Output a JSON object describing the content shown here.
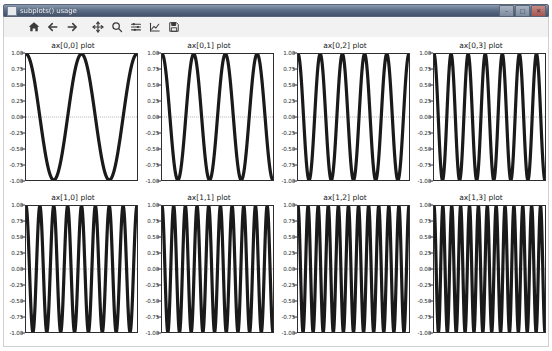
{
  "window": {
    "title": "subplots() usage",
    "icon": "app-icon",
    "buttons": [
      {
        "name": "minimize",
        "glyph": "–"
      },
      {
        "name": "maximize",
        "glyph": "□"
      },
      {
        "name": "close",
        "glyph": "✕"
      }
    ]
  },
  "toolbar": {
    "items": [
      {
        "name": "home-icon",
        "tooltip": "Reset original view"
      },
      {
        "name": "back-arrow-icon",
        "tooltip": "Back to previous view"
      },
      {
        "name": "forward-arrow-icon",
        "tooltip": "Forward to next view"
      },
      {
        "name": "pan-icon",
        "tooltip": "Pan axes with left mouse, zoom with right"
      },
      {
        "name": "zoom-icon",
        "tooltip": "Zoom to rectangle"
      },
      {
        "name": "subplot-config-icon",
        "tooltip": "Configure subplots"
      },
      {
        "name": "customize-icon",
        "tooltip": "Edit axis, curve and image parameters"
      },
      {
        "name": "save-icon",
        "tooltip": "Save the figure"
      }
    ]
  },
  "chart_data": {
    "type": "line",
    "title": "subplots() usage",
    "layout": {
      "rows": 2,
      "cols": 4,
      "sharey": true
    },
    "xlabel": "",
    "ylabel": "",
    "xlim": [
      0,
      1
    ],
    "ylim": [
      -1.0,
      1.0
    ],
    "grid": false,
    "legend": null,
    "ytick_labels": [
      "1.00",
      "0.75",
      "0.50",
      "0.25",
      "0.00",
      "-0.25",
      "-0.50",
      "-0.75",
      "-1.00"
    ],
    "ytick_values": [
      1.0,
      0.75,
      0.5,
      0.25,
      0.0,
      -0.25,
      -0.5,
      -0.75,
      -1.0
    ],
    "zero_line": {
      "value": 0.0,
      "style": "dashed",
      "color": "#444444"
    },
    "line_color": "#1a1a1a",
    "line_width": 0.8,
    "panels": [
      {
        "id": "ax00",
        "title": "ax[0,0] plot",
        "row": 0,
        "col": 0,
        "waveform": "cosine",
        "cycles": 2.0,
        "amplitude": 1.0,
        "phase": 0.0
      },
      {
        "id": "ax01",
        "title": "ax[0,1] plot",
        "row": 0,
        "col": 1,
        "waveform": "cosine",
        "cycles": 3.5,
        "amplitude": 1.0,
        "phase": 0.0
      },
      {
        "id": "ax02",
        "title": "ax[0,2] plot",
        "row": 0,
        "col": 2,
        "waveform": "cosine",
        "cycles": 5.0,
        "amplitude": 1.0,
        "phase": 0.0
      },
      {
        "id": "ax03",
        "title": "ax[0,3] plot",
        "row": 0,
        "col": 3,
        "waveform": "cosine",
        "cycles": 6.5,
        "amplitude": 1.0,
        "phase": 0.0
      },
      {
        "id": "ax10",
        "title": "ax[1,0] plot",
        "row": 1,
        "col": 0,
        "waveform": "cosine",
        "cycles": 8.0,
        "amplitude": 1.0,
        "phase": 0.0
      },
      {
        "id": "ax11",
        "title": "ax[1,1] plot",
        "row": 1,
        "col": 1,
        "waveform": "cosine",
        "cycles": 9.5,
        "amplitude": 1.0,
        "phase": 0.0
      },
      {
        "id": "ax12",
        "title": "ax[1,2] plot",
        "row": 1,
        "col": 2,
        "waveform": "cosine",
        "cycles": 11.0,
        "amplitude": 1.0,
        "phase": 0.0
      },
      {
        "id": "ax13",
        "title": "ax[1,3] plot",
        "row": 1,
        "col": 3,
        "waveform": "cosine",
        "cycles": 12.5,
        "amplitude": 1.0,
        "phase": 0.0
      }
    ]
  }
}
